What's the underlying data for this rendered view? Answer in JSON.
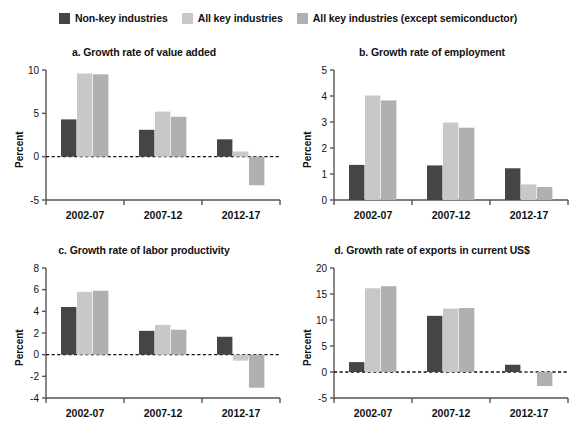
{
  "legend": {
    "items": [
      {
        "label": "Non-key industries",
        "color": "#454545",
        "icon": "legend-swatch-icon"
      },
      {
        "label": "All key industries",
        "color": "#c8c8c8",
        "icon": "legend-swatch-icon"
      },
      {
        "label": "All key industries (except semiconductor)",
        "color": "#b0b0b0",
        "icon": "legend-swatch-icon"
      }
    ]
  },
  "colors": {
    "series1": "#454545",
    "series2": "#c8c8c8",
    "series3": "#b0b0b0",
    "axis": "#555555",
    "zero_line": "#111111",
    "text": "#111111"
  },
  "chart_data": [
    {
      "type": "bar",
      "panel": "a",
      "title": "a. Growth rate of value added",
      "xlabel": "",
      "ylabel": "Percent",
      "categories": [
        "2002-07",
        "2007-12",
        "2012-17"
      ],
      "ylim": [
        -5,
        10
      ],
      "yticks": [
        -5,
        0,
        5,
        10
      ],
      "ytick_labels": [
        "-5",
        "0",
        "5",
        "10"
      ],
      "grid": false,
      "legend_position": "top-center",
      "series": [
        {
          "name": "Non-key industries",
          "values": [
            4.3,
            3.1,
            2.0
          ]
        },
        {
          "name": "All key industries",
          "values": [
            9.6,
            5.2,
            0.6
          ]
        },
        {
          "name": "All key industries (except semiconductor)",
          "values": [
            9.5,
            4.6,
            -3.3
          ]
        }
      ]
    },
    {
      "type": "bar",
      "panel": "b",
      "title": "b. Growth rate of employment",
      "xlabel": "",
      "ylabel": "Percent",
      "categories": [
        "2002-07",
        "2007-12",
        "2012-17"
      ],
      "ylim": [
        0,
        5
      ],
      "yticks": [
        0,
        1,
        2,
        3,
        4,
        5
      ],
      "ytick_labels": [
        "0",
        "1",
        "2",
        "3",
        "4",
        "5"
      ],
      "grid": false,
      "legend_position": "top-center",
      "series": [
        {
          "name": "Non-key industries",
          "values": [
            1.35,
            1.33,
            1.22
          ]
        },
        {
          "name": "All key industries",
          "values": [
            4.02,
            2.98,
            0.6
          ]
        },
        {
          "name": "All key industries (except semiconductor)",
          "values": [
            3.83,
            2.78,
            0.5
          ]
        }
      ]
    },
    {
      "type": "bar",
      "panel": "c",
      "title": "c. Growth rate of labor productivity",
      "xlabel": "",
      "ylabel": "Percent",
      "categories": [
        "2002-07",
        "2007-12",
        "2012-17"
      ],
      "ylim": [
        -4,
        8
      ],
      "yticks": [
        -4,
        -2,
        0,
        2,
        4,
        6,
        8
      ],
      "ytick_labels": [
        "-4",
        "-2",
        "0",
        "2",
        "4",
        "6",
        "8"
      ],
      "grid": false,
      "legend_position": "top-center",
      "series": [
        {
          "name": "Non-key industries",
          "values": [
            4.4,
            2.2,
            1.65
          ]
        },
        {
          "name": "All key industries",
          "values": [
            5.8,
            2.75,
            -0.55
          ]
        },
        {
          "name": "All key industries (except semiconductor)",
          "values": [
            5.9,
            2.3,
            -3.05
          ]
        }
      ]
    },
    {
      "type": "bar",
      "panel": "d",
      "title": "d. Growth rate of exports in current US$",
      "xlabel": "",
      "ylabel": "Percent",
      "categories": [
        "2002-07",
        "2007-12",
        "2012-17"
      ],
      "ylim": [
        -5,
        20
      ],
      "yticks": [
        -5,
        0,
        5,
        10,
        15,
        20
      ],
      "ytick_labels": [
        "-5",
        "0",
        "5",
        "10",
        "15",
        "20"
      ],
      "grid": false,
      "legend_position": "top-center",
      "series": [
        {
          "name": "Non-key industries",
          "values": [
            1.9,
            10.8,
            1.4
          ]
        },
        {
          "name": "All key industries",
          "values": [
            16.1,
            12.2,
            0.05
          ]
        },
        {
          "name": "All key industries (except semiconductor)",
          "values": [
            16.5,
            12.3,
            -2.7
          ]
        }
      ]
    }
  ]
}
